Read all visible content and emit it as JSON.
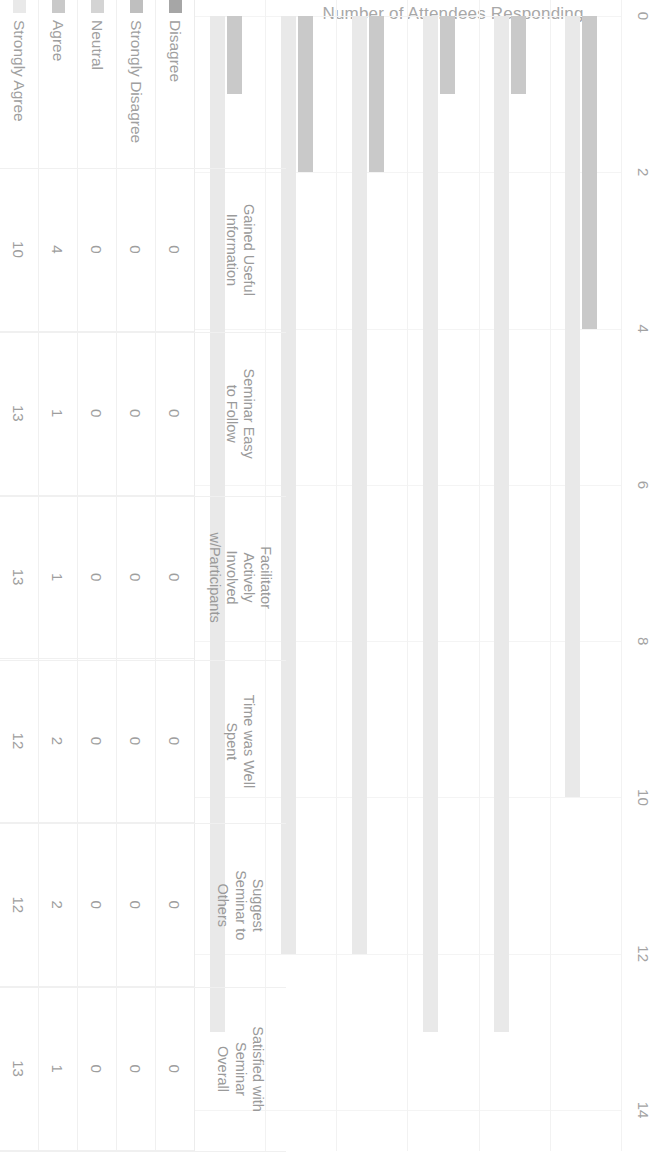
{
  "chart_data": {
    "type": "bar",
    "orientation": "horizontal",
    "title": "Number of Attendees Responding",
    "xlabel": "",
    "ylabel": "",
    "xlim": [
      0,
      14
    ],
    "xticks": [
      0,
      2,
      4,
      6,
      8,
      10,
      12,
      14
    ],
    "grid": true,
    "legend_position": "bottom",
    "page_rotation_degrees": 90,
    "categories": [
      "Gained Useful Information",
      "Seminar Easy to Follow",
      "Facilitator Actively Involved w/Participants",
      "Time was Well Spent",
      "Suggest Seminar to Others",
      "Satisfied with Seminar Overall"
    ],
    "category_lines": [
      [
        "Gained Useful",
        "Information"
      ],
      [
        "Seminar Easy",
        "to Follow"
      ],
      [
        "Facilitator",
        "Actively",
        "Involved",
        "w/Participants"
      ],
      [
        "Time was Well",
        "Spent"
      ],
      [
        "Suggest",
        "Seminar to",
        "Others"
      ],
      [
        "Satisfied with",
        "Seminar",
        "Overall"
      ]
    ],
    "series": [
      {
        "name": "Disagree",
        "color": "#a6a6a6",
        "values": [
          0,
          0,
          0,
          0,
          0,
          0
        ]
      },
      {
        "name": "Strongly Disagree",
        "color": "#bfbfbf",
        "values": [
          0,
          0,
          0,
          0,
          0,
          0
        ]
      },
      {
        "name": "Neutral",
        "color": "#d4d4d4",
        "values": [
          0,
          0,
          0,
          0,
          0,
          0
        ]
      },
      {
        "name": "Agree",
        "color": "#c9c9c9",
        "values": [
          4,
          1,
          1,
          2,
          2,
          1
        ]
      },
      {
        "name": "Strongly Agree",
        "color": "#e9e9e9",
        "values": [
          10,
          13,
          13,
          12,
          12,
          13
        ]
      }
    ]
  },
  "table": {
    "row_labels": [
      "Disagree",
      "Strongly Disagree",
      "Neutral",
      "Agree",
      "Strongly Agree"
    ],
    "rows": [
      {
        "label": "Disagree",
        "values": [
          "0",
          "0",
          "0",
          "0",
          "0",
          "0"
        ]
      },
      {
        "label": "Strongly Disagree",
        "values": [
          "0",
          "0",
          "0",
          "0",
          "0",
          "0"
        ]
      },
      {
        "label": "Neutral",
        "values": [
          "0",
          "0",
          "0",
          "0",
          "0",
          "0"
        ]
      },
      {
        "label": "Agree",
        "values": [
          "4",
          "1",
          "1",
          "2",
          "2",
          "1"
        ]
      },
      {
        "label": "Strongly Agree",
        "values": [
          "10",
          "13",
          "13",
          "12",
          "12",
          "13"
        ]
      }
    ]
  },
  "colors": {
    "text": "#9e9e9e",
    "title": "#a8a8a8",
    "gridline": "#f4f4f4",
    "table_border": "#f0f0f0",
    "background": "#ffffff"
  }
}
